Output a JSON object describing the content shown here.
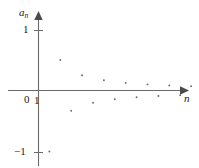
{
  "figure": {
    "width": 199,
    "height": 168,
    "background_color": "#ffffff",
    "axis_color": "#5a5a5a",
    "point_color": "#6b6b6b",
    "text_color": "#1a1a1a"
  },
  "labels": {
    "y_axis": "a",
    "y_axis_subscript": "n",
    "x_axis": "n",
    "origin": "0",
    "y_tick_top": "1",
    "y_tick_bottom": "−1",
    "x_tick_one": "1"
  },
  "chart_data": {
    "type": "scatter",
    "title": "",
    "xlabel": "n",
    "ylabel": "a_n",
    "grid": false,
    "legend": null,
    "xlim": [
      0,
      16
    ],
    "ylim": [
      -1.25,
      1.25
    ],
    "xticks": [
      1
    ],
    "xticklabels": [
      "1"
    ],
    "yticks": [
      -1,
      0,
      1
    ],
    "yticklabels": [
      "−1",
      "0",
      "1"
    ],
    "x": [
      1,
      2,
      3,
      4,
      5,
      6,
      7,
      8,
      9,
      10,
      11,
      12,
      13,
      14,
      15
    ],
    "y": [
      -1,
      0.5,
      -0.333,
      0.25,
      -0.2,
      0.167,
      -0.143,
      0.125,
      -0.111,
      0.1,
      -0.091,
      0.083,
      -0.077,
      0.071,
      -0.067
    ],
    "series": [
      {
        "name": "a_n",
        "values": [
          -1,
          0.5,
          -0.333,
          0.25,
          -0.2,
          0.167,
          -0.143,
          0.125,
          -0.111,
          0.1,
          -0.091,
          0.083,
          -0.077,
          0.071,
          -0.067
        ]
      }
    ]
  }
}
